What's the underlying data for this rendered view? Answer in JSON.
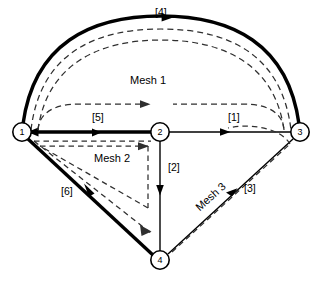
{
  "figure": {
    "title": "",
    "nodes": [
      {
        "id": "1",
        "label": "1",
        "x": 22,
        "y": 132
      },
      {
        "id": "2",
        "label": "2",
        "x": 160,
        "y": 132
      },
      {
        "id": "3",
        "label": "3",
        "x": 300,
        "y": 132
      },
      {
        "id": "4",
        "label": "4",
        "x": 160,
        "y": 260
      }
    ],
    "branches": [
      {
        "label": "[1]",
        "from": "2",
        "to": "3",
        "style": "thin",
        "shape": "straight",
        "label_x": 228,
        "label_y": 112
      },
      {
        "label": "[2]",
        "from": "2",
        "to": "4",
        "style": "thin",
        "shape": "straight",
        "label_x": 168,
        "label_y": 162
      },
      {
        "label": "[3]",
        "from": "4",
        "to": "3",
        "style": "thin",
        "shape": "straight",
        "label_x": 244,
        "label_y": 183
      },
      {
        "label": "[4]",
        "from": "3",
        "to": "1",
        "style": "thick",
        "shape": "arc",
        "label_x": 156,
        "label_y": 8
      },
      {
        "label": "[5]",
        "from": "2",
        "to": "1",
        "style": "thick",
        "shape": "straight",
        "label_x": 92,
        "label_y": 112
      },
      {
        "label": "[6]",
        "from": "1",
        "to": "4",
        "style": "thick",
        "shape": "straight",
        "label_x": 61,
        "label_y": 186
      }
    ],
    "meshes": [
      {
        "label": "Mesh 1",
        "label_x": 130,
        "label_y": 75,
        "rotation": 0,
        "direction": "clockwise"
      },
      {
        "label": "Mesh 2",
        "label_x": 94,
        "label_y": 153,
        "rotation": 0,
        "direction": "clockwise"
      },
      {
        "label": "Mesh 3",
        "label_x": 193,
        "label_y": 204,
        "rotation": -42,
        "direction": "clockwise"
      }
    ],
    "colors": {
      "line": "#000000",
      "background": "#ffffff",
      "dashed": "#3a3a3a"
    }
  }
}
